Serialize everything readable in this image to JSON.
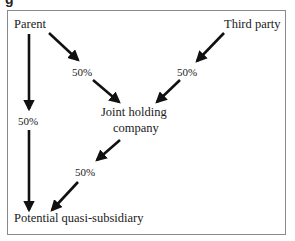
{
  "caption_fragment": "g",
  "diagram": {
    "nodes": {
      "parent": "Parent",
      "third_party": "Third party",
      "joint_line1": "Joint holding",
      "joint_line2": "company",
      "subsidiary": "Potential quasi-subsidiary"
    },
    "edges": {
      "parent_to_joint": "50%",
      "third_to_joint": "50%",
      "parent_to_subsidiary": "50%",
      "joint_to_subsidiary": "50%"
    },
    "colors": {
      "arrow": "#111111",
      "frame": "#8a8a8a"
    }
  }
}
